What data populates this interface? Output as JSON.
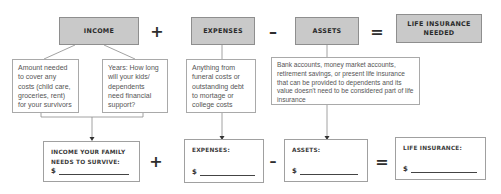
{
  "headers": {
    "income": "INCOME",
    "expenses": "EXPENSES",
    "assets": "ASSETS",
    "life_insurance_needed": "LIFE INSURANCE NEEDED"
  },
  "operators": {
    "plus": "+",
    "minus": "–",
    "equals": "="
  },
  "descriptions": {
    "income_amount": "Amount needed to cover any costs (child care, groceries, rent) for your survivors",
    "income_years": "Years: How long will your kids/ dependents need financial support?",
    "expenses": "Anything from funeral costs or outstanding debt to mortage or college costs",
    "assets": "Bank accounts, money market accounts, retirement savings, or present life insurance that can be provided to dependents and its value doesn't need to be considered part of life insurance"
  },
  "results": {
    "income": {
      "label": "INCOME YOUR FAMILY NEEDS TO SURVIVE:",
      "currency": "$"
    },
    "expenses": {
      "label": "EXPENSES:",
      "currency": "$"
    },
    "assets": {
      "label": "ASSETS:",
      "currency": "$"
    },
    "life_insurance": {
      "label": "LIFE INSURANCE:",
      "currency": "$"
    }
  }
}
